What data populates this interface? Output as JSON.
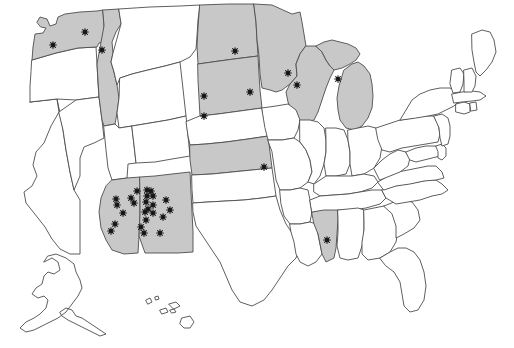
{
  "figure": {
    "type": "choropleth-point-map",
    "region": "United States",
    "width": 514,
    "height": 348,
    "background_color": "#ffffff"
  },
  "legend_colors": {
    "highlight_fill": "#c8c8c8",
    "plain_fill": "#ffffff",
    "border_stroke": "#4d4d4d",
    "marker_color": "#151515"
  },
  "highlighted_states": [
    "Washington",
    "Idaho",
    "North Dakota",
    "South Dakota",
    "Minnesota",
    "Wisconsin",
    "Michigan",
    "Kansas",
    "Arizona",
    "New Mexico",
    "Mississippi"
  ],
  "marker_counts_by_state": {
    "Washington": 2,
    "Idaho": 1,
    "North Dakota": 1,
    "South Dakota": 3,
    "Minnesota": 1,
    "Wisconsin": 1,
    "Michigan": 1,
    "Kansas": 1,
    "Arizona": 8,
    "New Mexico": 16,
    "Mississippi": 1
  },
  "total_markers": 36,
  "markers": [
    {
      "state": "Washington",
      "x": 85,
      "y": 32
    },
    {
      "state": "Washington",
      "x": 53,
      "y": 45
    },
    {
      "state": "Idaho",
      "x": 102,
      "y": 50
    },
    {
      "state": "North Dakota",
      "x": 235,
      "y": 51
    },
    {
      "state": "South Dakota",
      "x": 250,
      "y": 92
    },
    {
      "state": "South Dakota",
      "x": 204,
      "y": 96
    },
    {
      "state": "South Dakota",
      "x": 204,
      "y": 116
    },
    {
      "state": "Minnesota",
      "x": 288,
      "y": 73
    },
    {
      "state": "Wisconsin",
      "x": 297,
      "y": 85
    },
    {
      "state": "Michigan",
      "x": 338,
      "y": 79
    },
    {
      "state": "Kansas",
      "x": 264,
      "y": 167
    },
    {
      "state": "Arizona",
      "x": 137,
      "y": 191
    },
    {
      "state": "Arizona",
      "x": 131,
      "y": 198
    },
    {
      "state": "Arizona",
      "x": 116,
      "y": 199
    },
    {
      "state": "Arizona",
      "x": 134,
      "y": 203
    },
    {
      "state": "Arizona",
      "x": 117,
      "y": 205
    },
    {
      "state": "Arizona",
      "x": 123,
      "y": 213
    },
    {
      "state": "Arizona",
      "x": 115,
      "y": 224
    },
    {
      "state": "Arizona",
      "x": 111,
      "y": 231
    },
    {
      "state": "New Mexico",
      "x": 147,
      "y": 190
    },
    {
      "state": "New Mexico",
      "x": 151,
      "y": 191
    },
    {
      "state": "New Mexico",
      "x": 147,
      "y": 196
    },
    {
      "state": "New Mexico",
      "x": 153,
      "y": 196
    },
    {
      "state": "New Mexico",
      "x": 146,
      "y": 202
    },
    {
      "state": "New Mexico",
      "x": 148,
      "y": 209
    },
    {
      "state": "New Mexico",
      "x": 153,
      "y": 205
    },
    {
      "state": "New Mexico",
      "x": 145,
      "y": 212
    },
    {
      "state": "New Mexico",
      "x": 146,
      "y": 220
    },
    {
      "state": "New Mexico",
      "x": 153,
      "y": 213
    },
    {
      "state": "New Mexico",
      "x": 144,
      "y": 233
    },
    {
      "state": "New Mexico",
      "x": 160,
      "y": 233
    },
    {
      "state": "New Mexico",
      "x": 166,
      "y": 200
    },
    {
      "state": "New Mexico",
      "x": 170,
      "y": 210
    },
    {
      "state": "New Mexico",
      "x": 163,
      "y": 217
    },
    {
      "state": "New Mexico",
      "x": 141,
      "y": 227
    },
    {
      "state": "Mississippi",
      "x": 327,
      "y": 240
    }
  ],
  "unhighlighted_states": [
    "Oregon",
    "California",
    "Nevada",
    "Utah",
    "Montana",
    "Wyoming",
    "Colorado",
    "Nebraska",
    "Iowa",
    "Missouri",
    "Oklahoma",
    "Texas",
    "Arkansas",
    "Louisiana",
    "Illinois",
    "Indiana",
    "Ohio",
    "Kentucky",
    "Tennessee",
    "Alabama",
    "Georgia",
    "Florida",
    "South Carolina",
    "North Carolina",
    "Virginia",
    "West Virginia",
    "Maryland",
    "Delaware",
    "Pennsylvania",
    "New Jersey",
    "New York",
    "Connecticut",
    "Rhode Island",
    "Massachusetts",
    "Vermont",
    "New Hampshire",
    "Maine",
    "Alaska",
    "Hawaii"
  ]
}
